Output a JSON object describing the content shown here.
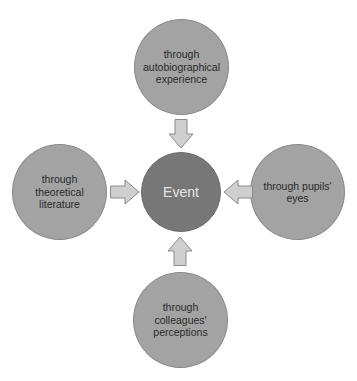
{
  "diagram": {
    "center": {
      "label": "Event"
    },
    "nodes": [
      {
        "position": "top",
        "label": "through\nautobiographical\nexperience"
      },
      {
        "position": "left",
        "label": "through\ntheoretical\nliterature"
      },
      {
        "position": "right",
        "label": "through pupils'\neyes"
      },
      {
        "position": "bottom",
        "label": "through\ncolleagues'\nperceptions"
      }
    ],
    "arrows": [
      {
        "from": "top",
        "to": "center",
        "direction": "down"
      },
      {
        "from": "left",
        "to": "center",
        "direction": "right"
      },
      {
        "from": "right",
        "to": "center",
        "direction": "left"
      },
      {
        "from": "bottom",
        "to": "center",
        "direction": "up"
      }
    ],
    "colors": {
      "outer_fill": "#a3a3a3",
      "center_fill": "#777777",
      "arrow_fill": "#cfcfcf",
      "arrow_stroke": "#8a8a8a"
    }
  }
}
